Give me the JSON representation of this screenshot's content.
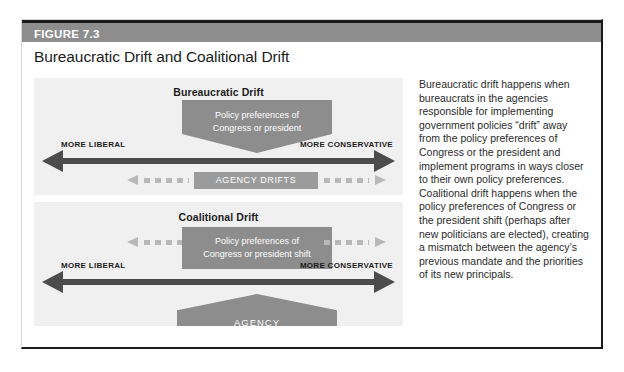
{
  "figure": {
    "number_label": "FIGURE 7.3",
    "title": "Bureaucratic Drift and Coalitional Drift"
  },
  "panels": {
    "top": {
      "title": "Bureaucratic Drift",
      "callout_line1": "Policy preferences of",
      "callout_line2": "Congress or president",
      "axis_left_label": "MORE LIBERAL",
      "axis_right_label": "MORE CONSERVATIVE",
      "drift_box_label": "AGENCY DRIFTS"
    },
    "bottom": {
      "title": "Coalitional Drift",
      "callout_line1": "Policy preferences of",
      "callout_line2": "Congress or president shift",
      "axis_left_label": "MORE LIBERAL",
      "axis_right_label": "MORE CONSERVATIVE",
      "agency_label": "AGENCY"
    }
  },
  "caption": {
    "text": "Bureaucratic drift happens when bureaucrats in the agencies responsible for implementing government policies “drift” away from the policy preferences of Congress or the president and implement programs in ways closer to their own policy preferences. Coalitional drift happens when the policy preferences of Congress or the president shift (perhaps after new politicians are elected), creating a mismatch between the agency’s previous mandate and the priorities of its new principals."
  },
  "colors": {
    "header_bar": "#8d8d8d",
    "panel_background": "#f0f0f0",
    "arrow_dark": "#4c4c4c",
    "shape_gray": "#8d8d8d",
    "dashed_gray": "#b8b8b8",
    "text_dark": "#1c1c1c"
  }
}
